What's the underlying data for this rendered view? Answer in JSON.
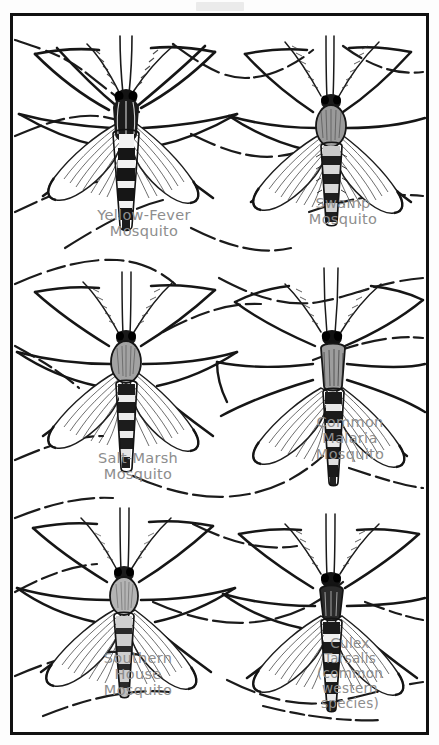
{
  "plate": {
    "title": "Mosquito Identification Plate",
    "background_color": "#ffffff",
    "border_color": "#111111",
    "label_color": "#8d8d8d",
    "ink_color": "#1a1a1a",
    "columns": 2,
    "rows": 3,
    "total_specimens": 6
  },
  "specimens": [
    {
      "id": "yellow-fever-mosquito",
      "label": "Yellow-Fever\nMosquito",
      "name_lines": [
        "Yellow-Fever",
        "Mosquito"
      ],
      "column": "left",
      "row": 1,
      "abdomen_banding": "bold dark bands with pale rings",
      "posture": "wings folded back, legs splayed wide"
    },
    {
      "id": "swamp-mosquito",
      "label": "Swamp\nMosquito",
      "name_lines": [
        "Swamp",
        "Mosquito"
      ],
      "column": "right",
      "row": 1,
      "abdomen_banding": "pale bands, plumed antennae",
      "posture": "wings drooping, long hind legs raised"
    },
    {
      "id": "salt-marsh-mosquito",
      "label": "Salt-Marsh\nMosquito",
      "name_lines": [
        "Salt-Marsh",
        "Mosquito"
      ],
      "column": "left",
      "row": 2,
      "abdomen_banding": "checkered dark and light segments",
      "posture": "wings spread low, legs arched"
    },
    {
      "id": "common-malaria-mosquito",
      "label": "Common\nMalaria\nMosquito",
      "name_lines": [
        "Common",
        "Malaria",
        "Mosquito"
      ],
      "column": "right",
      "row": 2,
      "abdomen_banding": "dark speckled bands",
      "posture": "body angled, wings swept outward"
    },
    {
      "id": "southern-house-mosquito",
      "label": "Southern\nHouse\nMosquito",
      "name_lines": [
        "Southern",
        "House",
        "Mosquito"
      ],
      "column": "left",
      "row": 3,
      "abdomen_banding": "faint pale crossbands",
      "posture": "wings folded over abdomen"
    },
    {
      "id": "culex-tarsalis",
      "label": "Culex\nTarsalis\n(common\nwestern\nspecies)",
      "name_lines": [
        "Culex",
        "Tarsalis",
        "(common",
        "western",
        "species)"
      ],
      "column": "right",
      "row": 3,
      "abdomen_banding": "strong dark and white bands",
      "posture": "wings folded, banded legs"
    }
  ]
}
